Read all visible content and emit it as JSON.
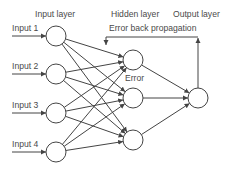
{
  "colors": {
    "line": "#444444",
    "text": "#4a4a4a",
    "node_fill": "#ffffff",
    "background": "#ffffff"
  },
  "layers": {
    "input": {
      "label": "Input layer",
      "label_pos": [
        35,
        17
      ],
      "nodes": [
        {
          "id": "i1",
          "label": "Input 1",
          "cx": 56,
          "cy": 36
        },
        {
          "id": "i2",
          "label": "Input 2",
          "cx": 56,
          "cy": 74
        },
        {
          "id": "i3",
          "label": "Input 3",
          "cx": 56,
          "cy": 113
        },
        {
          "id": "i4",
          "label": "Input 4",
          "cx": 56,
          "cy": 152
        }
      ]
    },
    "hidden": {
      "label": "Hidden layer",
      "label_pos": [
        111,
        17
      ],
      "nodes": [
        {
          "id": "h1",
          "cx": 133,
          "cy": 60
        },
        {
          "id": "h2",
          "cx": 133,
          "cy": 98
        },
        {
          "id": "h3",
          "cx": 133,
          "cy": 140
        }
      ]
    },
    "output": {
      "label": "Output layer",
      "label_pos": [
        173,
        17
      ],
      "nodes": [
        {
          "id": "o1",
          "cx": 198,
          "cy": 98
        }
      ]
    }
  },
  "node_radius": 10,
  "input_arrows": {
    "start_x": 12,
    "label_x": 12,
    "label_dy": -5
  },
  "error_label": {
    "text": "Error",
    "x": 125,
    "y": 81
  },
  "back_propagation": {
    "label": "Error back propagation",
    "label_x": 109,
    "label_y": 31,
    "line_y": 37,
    "left_x": 106,
    "right_x": 198,
    "down_to_y": 45
  }
}
